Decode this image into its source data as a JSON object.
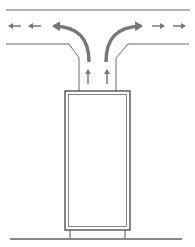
{
  "diagram": {
    "colors": {
      "background": "#ffffff",
      "line": "#555555",
      "duct_line": "#6a6a6a",
      "arrow": "#777777",
      "floor": "#888888"
    },
    "elements": {
      "ceiling_line": "ceiling",
      "duct_left_wall": "duct-left-wall",
      "duct_right_wall": "duct-right-wall",
      "cabinet": "cabinet",
      "floor": "floor",
      "airflow_arrows_left": 3,
      "airflow_arrows_right": 3,
      "airflow_arrows_up": 2
    }
  }
}
